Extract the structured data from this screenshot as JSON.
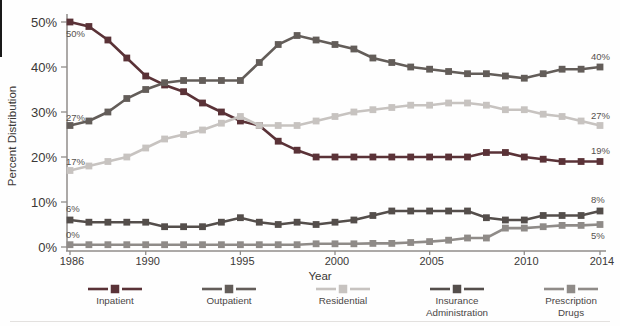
{
  "chart_data": {
    "type": "line",
    "title": "",
    "xlabel": "Year",
    "ylabel": "Percent Distribution",
    "ylim": [
      0,
      50
    ],
    "x_range": [
      1986,
      2014
    ],
    "grid": false,
    "legend_position": "bottom",
    "axis_color": "#908d8a",
    "tick_text_color": "#3b3836",
    "annotation_text_color": "#57524e",
    "legend_text_color": "#4a4645",
    "x": [
      1986,
      1987,
      1988,
      1989,
      1990,
      1991,
      1992,
      1993,
      1994,
      1995,
      1996,
      1997,
      1998,
      1999,
      2000,
      2001,
      2002,
      2003,
      2004,
      2005,
      2006,
      2007,
      2008,
      2009,
      2010,
      2011,
      2012,
      2013,
      2014
    ],
    "x_ticks": [
      1986,
      1990,
      1995,
      2000,
      2005,
      2010,
      2014
    ],
    "x_tick_labels": [
      "1986",
      "1990",
      "1995",
      "2000",
      "2005",
      "2010",
      "2014"
    ],
    "y_ticks": [
      0,
      10,
      20,
      30,
      40,
      50
    ],
    "y_tick_labels": [
      "0%",
      "10%",
      "20%",
      "30%",
      "40%",
      "50%"
    ],
    "series": [
      {
        "name": "Inpatient",
        "legend": [
          "Inpatient"
        ],
        "color": "#5a3237",
        "values": [
          50,
          49,
          46,
          42,
          38,
          36,
          34.5,
          32,
          30,
          28,
          27,
          23.5,
          21.5,
          20,
          20,
          20,
          20,
          20,
          20,
          20,
          20,
          20,
          21,
          21,
          20,
          19.5,
          19,
          19,
          19
        ],
        "start_label": "50%",
        "end_label": "19%",
        "start_label_dy": 15,
        "end_label_dy": -8
      },
      {
        "name": "Outpatient",
        "legend": [
          "Outpatient"
        ],
        "color": "#635d59",
        "values": [
          27,
          28,
          30,
          33,
          35,
          36.5,
          37,
          37,
          37,
          37,
          41,
          45,
          47,
          46,
          45,
          44,
          42,
          41,
          40,
          39.5,
          39,
          38.5,
          38.5,
          38,
          37.5,
          38.5,
          39.5,
          39.5,
          40
        ],
        "start_label": "27%",
        "end_label": "40%",
        "start_label_dy": -5,
        "end_label_dy": -7
      },
      {
        "name": "Residential",
        "legend": [
          "Residential"
        ],
        "color": "#c7c3c0",
        "values": [
          17,
          18,
          19,
          20,
          22,
          24,
          25,
          26,
          27.5,
          29,
          27,
          27,
          27,
          28,
          29,
          30,
          30.5,
          31,
          31.5,
          31.5,
          32,
          32,
          31.5,
          30.5,
          30.5,
          29.5,
          29,
          28,
          27
        ],
        "start_label": "17%",
        "end_label": "27%",
        "start_label_dy": -6,
        "end_label_dy": -7
      },
      {
        "name": "Insurance Administration",
        "legend": [
          "Insurance",
          "Administration"
        ],
        "color": "#544e4b",
        "values": [
          6,
          5.5,
          5.5,
          5.5,
          5.5,
          4.5,
          4.5,
          4.5,
          5.5,
          6.5,
          5.5,
          5,
          5.5,
          5,
          5.5,
          6,
          7,
          8,
          8,
          8,
          8,
          8,
          6.5,
          6,
          6,
          7,
          7,
          7,
          8
        ],
        "start_label": "6%",
        "end_label": "8%",
        "start_label_dy": -8,
        "end_label_dy": -8
      },
      {
        "name": "Prescription Drugs",
        "legend": [
          "Prescription",
          "Drugs"
        ],
        "color": "#8f8b88",
        "values": [
          0.5,
          0.5,
          0.5,
          0.5,
          0.5,
          0.5,
          0.5,
          0.5,
          0.5,
          0.5,
          0.5,
          0.5,
          0.5,
          0.7,
          0.7,
          0.7,
          0.8,
          0.8,
          1,
          1.2,
          1.5,
          2,
          2,
          4.2,
          4.2,
          4.5,
          4.8,
          4.8,
          5
        ],
        "start_label": "0%",
        "end_label": "5%",
        "start_label_dy": -7,
        "end_label_dy": 14
      }
    ]
  }
}
